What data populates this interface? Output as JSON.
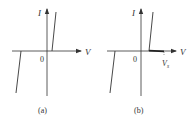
{
  "figure": {
    "panels": [
      {
        "id": "a",
        "caption": "(a)",
        "axis_x_label": "V",
        "axis_y_label": "I",
        "origin_label": "0",
        "curve": "ideal diode characteristic: forward branch steep line, reverse branch breakdown line"
      },
      {
        "id": "b",
        "caption": "(b)",
        "axis_x_label": "V",
        "axis_y_label": "I",
        "origin_label": "0",
        "voltage_marker_label": "V",
        "voltage_marker_subscript": "s",
        "curve": "diode characteristic with saturation segment up to Vs"
      }
    ],
    "colors": {
      "line": "#333333",
      "background": "#ffffff"
    }
  }
}
